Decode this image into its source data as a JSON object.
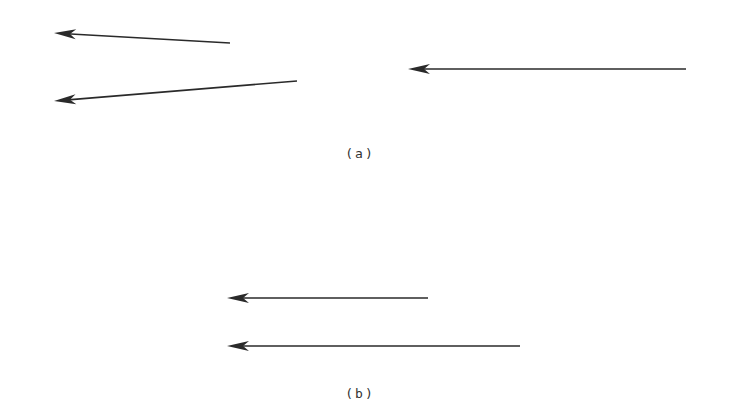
{
  "figure": {
    "stroke_color": "#2a2a2a",
    "panels": [
      {
        "id": "a",
        "label": "(a)",
        "label_pos": [
          360,
          153
        ],
        "arrows": [
          {
            "name": "arrow-a-upper-left",
            "tail": [
              230,
              43
            ],
            "head": [
              54,
              33
            ]
          },
          {
            "name": "arrow-a-lower-left",
            "tail": [
              297,
              81
            ],
            "head": [
              54,
              101
            ]
          },
          {
            "name": "arrow-a-right",
            "tail": [
              686,
              69
            ],
            "head": [
              408,
              69
            ]
          }
        ]
      },
      {
        "id": "b",
        "label": "(b)",
        "label_pos": [
          360,
          393
        ],
        "arrows": [
          {
            "name": "arrow-b-short",
            "tail": [
              428,
              298
            ],
            "head": [
              227,
              298
            ]
          },
          {
            "name": "arrow-b-long",
            "tail": [
              520,
              346
            ],
            "head": [
              227,
              346
            ]
          }
        ]
      }
    ]
  }
}
